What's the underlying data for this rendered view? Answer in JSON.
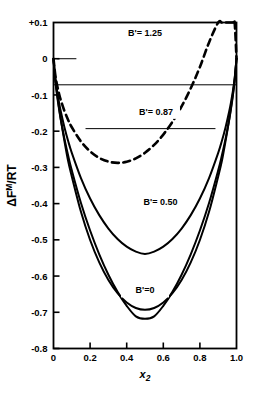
{
  "chart_data": {
    "type": "line",
    "title": "",
    "xlabel": "x₂",
    "ylabel": "ΔFᴹ/RT",
    "ylabel_parts": {
      "delta": "Δ",
      "f": "F",
      "sup": "M",
      "rest": "/RT"
    },
    "xlim": [
      0.0,
      1.0
    ],
    "ylim": [
      -0.8,
      0.1
    ],
    "grid": false,
    "legend": "inline-curve-labels",
    "xticks": [
      0.0,
      0.2,
      0.4,
      0.6,
      0.8,
      1.0
    ],
    "xticklabels": [
      "0",
      "0.2",
      "0.4",
      "0.6",
      "0.8",
      "1.0"
    ],
    "yticks": [
      0.1,
      0.0,
      -0.1,
      -0.2,
      -0.3,
      -0.4,
      -0.5,
      -0.6,
      -0.7,
      -0.8
    ],
    "yticklabels": [
      "+0.1",
      "0",
      "-0.1",
      "-0.2",
      "-0.3",
      "-0.4",
      "-0.5",
      "-0.6",
      "-0.7",
      "-0.8"
    ],
    "model": "ΔFᴹ/RT = x·ln(x) + (1-x)·ln(1-x) + B'·x(1-x)",
    "series": [
      {
        "name": "B' = 1.25",
        "label": "B'= 1.25",
        "B": 1.25,
        "style": "dashed",
        "label_x": 0.5,
        "label_y": 0.063,
        "minimum": {
          "x": 0.5,
          "y": 0.0182
        },
        "x": [
          0.0,
          0.01,
          0.02,
          0.03,
          0.04,
          0.06,
          0.08,
          0.1,
          0.15,
          0.2,
          0.25,
          0.3,
          0.35,
          0.4,
          0.45,
          0.5,
          0.55,
          0.6,
          0.65,
          0.7,
          0.75,
          0.8,
          0.85,
          0.9,
          0.92,
          0.94,
          0.96,
          0.97,
          0.98,
          0.99,
          1.0
        ],
        "y": [
          0.0,
          -0.0457,
          -0.0738,
          -0.0959,
          -0.1144,
          -0.1447,
          -0.169,
          -0.1892,
          -0.2285,
          -0.2557,
          -0.2737,
          -0.284,
          -0.2875,
          -0.2844,
          -0.2751,
          -0.2596,
          -0.2378,
          -0.2094,
          -0.1741,
          -0.1317,
          -0.0815,
          -0.0229,
          0.045,
          0.1235,
          0.1574,
          0.1934,
          0.2315,
          0.2514,
          0.2718,
          0.2926,
          0.0
        ]
      },
      {
        "name": "B' = 0.87",
        "label": "B'= 0.87",
        "B": 0.87,
        "style": "solid",
        "label_x": 0.56,
        "label_y": -0.155,
        "minimum": {
          "x": 0.5,
          "y": -0.1958
        },
        "x": [
          0.0,
          0.01,
          0.02,
          0.03,
          0.04,
          0.06,
          0.08,
          0.1,
          0.15,
          0.2,
          0.25,
          0.3,
          0.35,
          0.4,
          0.45,
          0.5,
          0.55,
          0.6,
          0.65,
          0.7,
          0.75,
          0.8,
          0.85,
          0.9,
          0.92,
          0.94,
          0.96,
          0.97,
          0.98,
          0.99,
          1.0
        ],
        "y": [
          0.0,
          -0.0543,
          -0.0904,
          -0.12,
          -0.1457,
          -0.1897,
          -0.227,
          -0.2598,
          -0.3295,
          -0.3859,
          -0.4318,
          -0.4688,
          -0.4977,
          -0.5189,
          -0.5326,
          -0.5389,
          -0.5326,
          -0.5189,
          -0.4977,
          -0.4688,
          -0.4318,
          -0.3859,
          -0.3295,
          -0.2598,
          -0.227,
          -0.1897,
          -0.1457,
          -0.12,
          -0.0904,
          -0.0543,
          0.0
        ]
      },
      {
        "name": "B' = 0.50",
        "label": "B'= 0.50",
        "B": 0.5,
        "style": "solid",
        "label_x": 0.585,
        "label_y": -0.405,
        "minimum": {
          "x": 0.5,
          "y": -0.5182
        },
        "x": [
          0.0,
          0.01,
          0.02,
          0.03,
          0.04,
          0.06,
          0.08,
          0.1,
          0.15,
          0.2,
          0.25,
          0.3,
          0.35,
          0.4,
          0.45,
          0.5,
          0.55,
          0.6,
          0.65,
          0.7,
          0.75,
          0.8,
          0.85,
          0.9,
          0.92,
          0.94,
          0.96,
          0.97,
          0.98,
          0.99,
          1.0
        ],
        "y": [
          0.0,
          -0.061,
          -0.103,
          -0.1379,
          -0.1684,
          -0.2214,
          -0.2672,
          -0.3082,
          -0.3983,
          -0.4743,
          -0.5399,
          -0.5963,
          -0.6437,
          -0.6822,
          -0.7112,
          -0.7182,
          -0.7112,
          -0.6822,
          -0.6437,
          -0.5963,
          -0.5399,
          -0.4743,
          -0.3983,
          -0.3082,
          -0.2672,
          -0.2214,
          -0.1684,
          -0.1379,
          -0.103,
          -0.061,
          0.0
        ]
      },
      {
        "name": "B' = 0",
        "label": "B'=0",
        "B": 0.0,
        "style": "solid",
        "label_x": 0.5,
        "label_y": -0.648,
        "minimum": {
          "x": 0.5,
          "y": -0.6931
        },
        "x": [
          0.0,
          0.01,
          0.02,
          0.03,
          0.04,
          0.06,
          0.08,
          0.1,
          0.15,
          0.2,
          0.25,
          0.3,
          0.35,
          0.4,
          0.45,
          0.5,
          0.55,
          0.6,
          0.65,
          0.7,
          0.75,
          0.8,
          0.85,
          0.9,
          0.92,
          0.94,
          0.96,
          0.97,
          0.98,
          0.99,
          1.0
        ],
        "y": [
          0.0,
          -0.056,
          -0.098,
          -0.1345,
          -0.1677,
          -0.2279,
          -0.2827,
          -0.3251,
          -0.4227,
          -0.5004,
          -0.5623,
          -0.6109,
          -0.6474,
          -0.673,
          -0.6881,
          -0.6931,
          -0.6881,
          -0.673,
          -0.6474,
          -0.6109,
          -0.5623,
          -0.5004,
          -0.4227,
          -0.3251,
          -0.2827,
          -0.2279,
          -0.1677,
          -0.1345,
          -0.098,
          -0.056,
          0.0
        ]
      }
    ],
    "annotations": [
      {
        "name": "tie-line-upper",
        "type": "horizontal-line",
        "y": -0.072,
        "x_start": 0.0,
        "x_end": 1.0
      },
      {
        "name": "tie-line-lower",
        "type": "horizontal-line",
        "y": -0.193,
        "x_start": 0.175,
        "x_end": 0.885
      },
      {
        "name": "zero-level-tick",
        "type": "horizontal-segment",
        "y": 0.0,
        "x_start": 0.02,
        "x_end": 0.125
      }
    ],
    "colors": {
      "axis": "#000000",
      "curve": "#000000",
      "tieline": "#000000",
      "background": "#ffffff"
    }
  }
}
